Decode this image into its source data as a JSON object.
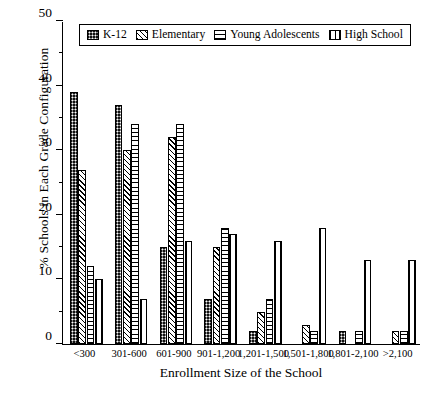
{
  "chart_data": {
    "type": "bar",
    "title": "",
    "xlabel": "Enrollment Size of the School",
    "ylabel": "% Schools in Each Grade Configuration",
    "ylim": [
      0,
      50
    ],
    "ytick_values": [
      0,
      10,
      20,
      30,
      40,
      50
    ],
    "ytick_labels": [
      "0",
      "10",
      "20",
      "30",
      "40",
      "50"
    ],
    "yminor_values": [
      5,
      15,
      25,
      35,
      45
    ],
    "grid": false,
    "legend_position": "top-center",
    "categories": [
      "<300",
      "301-600",
      "601-900",
      "901-1,200",
      "1,201-1,500",
      "1,501-1,800",
      "1,801-2,100",
      ">2,100"
    ],
    "series": [
      {
        "name": "K-12",
        "pattern": "checker-dark",
        "values": [
          39,
          37,
          15,
          7,
          2,
          0,
          2,
          0
        ]
      },
      {
        "name": "Elementary",
        "pattern": "diagonal-hatch",
        "values": [
          27,
          30,
          32,
          15,
          5,
          3,
          0,
          2
        ]
      },
      {
        "name": "Young Adolescents",
        "pattern": "horizontal-hatch",
        "values": [
          12,
          34,
          34,
          18,
          7,
          2,
          2,
          2
        ]
      },
      {
        "name": "High School",
        "pattern": "vertical-hatch",
        "values": [
          10,
          7,
          16,
          17,
          16,
          18,
          13,
          13
        ]
      }
    ]
  },
  "legend": {
    "items": [
      {
        "label": "K-12"
      },
      {
        "label": "Elementary"
      },
      {
        "label": "Young Adolescents"
      },
      {
        "label": "High School"
      }
    ]
  }
}
